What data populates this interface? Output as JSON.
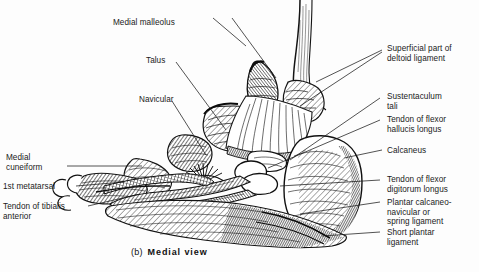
{
  "figure": {
    "caption_index": "(b)",
    "caption_text": "Medial view",
    "view": "Medial view",
    "style": "black-and-white engraved line drawing",
    "background_color": "#fdfdfd",
    "ink_color": "#1a1a1a"
  },
  "labels": {
    "medial_malleolus": "Medial malleolus",
    "talus": "Talus",
    "navicular": "Navicular",
    "medial_cuneiform": "Medial\ncuneiform",
    "first_metatarsal": "1st metatarsal",
    "tendon_of_tibialis_anterior": "Tendon of tibialis\nanterior",
    "superficial_deltoid": "Superficial part of\ndeltoid ligament",
    "sustentaculum_tali": "Sustentaculum\ntali",
    "tendon_flexor_hallucis_longus": "Tendon of flexor\nhallucis longus",
    "calcaneus": "Calcaneus",
    "tendon_flexor_digitorum_longus": "Tendon of flexor\ndigitorum longus",
    "plantar_calcaneonavicular": "Plantar calcaneo-\nnavicular or\nspring ligament",
    "short_plantar_ligament": "Short plantar\nligament"
  }
}
